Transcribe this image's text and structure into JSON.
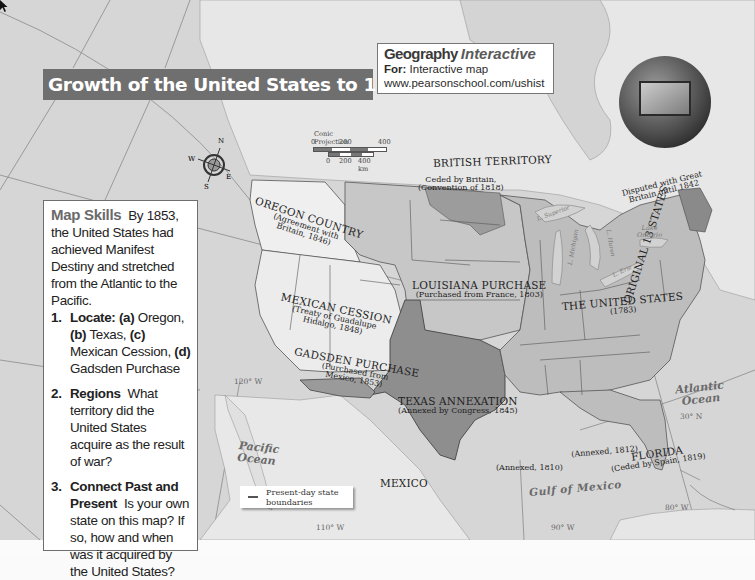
{
  "title": "Growth of the United States to 1853",
  "geography_interactive": {
    "brand": "Geography",
    "brand_italic": "Interactive",
    "for_label": "For:",
    "for_text": "Interactive map",
    "url": "www.pearsonschool.com/ushist"
  },
  "map_skills": {
    "heading": "Map Skills",
    "intro": "By 1853, the United States had achieved Manifest Destiny and stretched from the Atlantic to the Pacific.",
    "questions": [
      {
        "num": "1.",
        "label": "Locate:",
        "text_parts": [
          {
            "bold": "(a)",
            "text": " Oregon, "
          },
          {
            "bold": "(b)",
            "text": " Texas, "
          },
          {
            "bold": "(c)",
            "text": " Mexican Cession, "
          },
          {
            "bold": "(d)",
            "text": " Gadsden Purchase"
          }
        ]
      },
      {
        "num": "2.",
        "label": "Regions",
        "text": "What territory did the United States acquire as the result of war?"
      },
      {
        "num": "3.",
        "label": "Connect Past and Present",
        "text": "Is your own state on this map? If so, how and when was it acquired by the United States?"
      }
    ]
  },
  "scale_bar": {
    "projection": "Conic Projection",
    "miles": [
      "0",
      "200",
      "400 mi"
    ],
    "km": [
      "0",
      "200",
      "400 km"
    ]
  },
  "compass": {
    "n": "N",
    "s": "S",
    "e": "E",
    "w": "W"
  },
  "legend": {
    "items": [
      {
        "symbol": "line",
        "label": "Present-day state boundaries"
      }
    ]
  },
  "regions": {
    "british_territory": {
      "name": "BRITISH TERRITORY"
    },
    "ceded_by_britain": {
      "name": "Ceded by Britain,",
      "note": "(Convention of 1818)"
    },
    "disputed": {
      "name": "Disputed with Great",
      "note": "Britain until 1842"
    },
    "oregon": {
      "name": "OREGON COUNTRY",
      "note1": "(Agreement with",
      "note2": "Britain, 1846)"
    },
    "louisiana": {
      "name": "LOUISIANA PURCHASE",
      "note": "(Purchased from France, 1803)"
    },
    "mexican_cession": {
      "name": "MEXICAN CESSION",
      "note1": "(Treaty of Guadalupe",
      "note2": "Hidalgo, 1848)"
    },
    "gadsden": {
      "name": "GADSDEN PURCHASE",
      "note1": "(Purchased from",
      "note2": "Mexico, 1853)"
    },
    "texas": {
      "name": "TEXAS ANNEXATION",
      "note": "(Annexed by Congress, 1845)"
    },
    "united_states": {
      "name": "THE UNITED STATES",
      "note": "(1783)"
    },
    "original_13": {
      "name": "ORIGINAL 13 STATES"
    },
    "annexed_1810": {
      "note": "(Annexed, 1810)"
    },
    "annexed_1812": {
      "note": "(Annexed, 1812)"
    },
    "florida": {
      "name": "FLORIDA",
      "note": "(Ceded by Spain, 1819)"
    },
    "mexico": {
      "name": "MEXICO"
    }
  },
  "water": {
    "pacific": [
      "Pacific",
      "Ocean"
    ],
    "atlantic": [
      "Atlantic",
      "Ocean"
    ],
    "gulf": "Gulf of Mexico",
    "lake_superior": "L. Superior",
    "lake_michigan": "L. Michigan",
    "lake_huron": "L. Huron",
    "lake_erie": "L. Erie",
    "lake_ontario": [
      "Lake",
      "Ontario"
    ]
  },
  "gridlines": {
    "lon_120": "120° W",
    "lon_110": "110° W",
    "lon_90": "90° W",
    "lon_80": "80° W",
    "lat_30": "30° N"
  },
  "colors": {
    "title_bar": "#6f6f6f",
    "land_us": "#bdbdbd",
    "land_foreign": "#e6e6e6",
    "texas": "#8c8c8c",
    "water": "#d5d5d5"
  }
}
